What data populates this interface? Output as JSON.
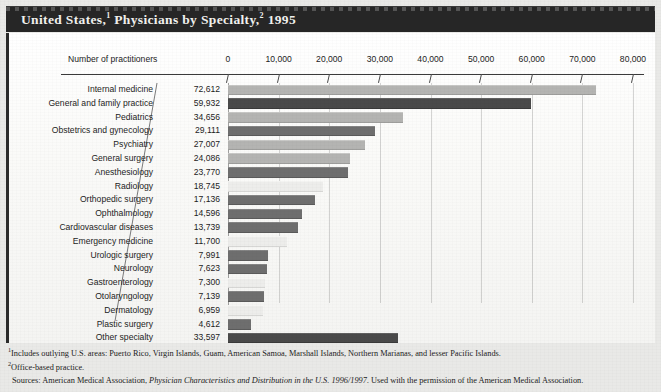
{
  "title": {
    "part1": "United States,",
    "sup1": "1",
    "part2": " Physicians by Specialty,",
    "sup2": "2",
    "part3": " 1995"
  },
  "axis_title": "Number of practitioners",
  "footnotes": {
    "note1_sup": "1",
    "note1": "Includes outlying U.S. areas: Puerto Rico, Virgin Islands, Guam, American Samoa, Marshall Islands, Northern Marianas, and lesser Pacific Islands.",
    "note2_sup": "2",
    "note2": "Office-based practice.",
    "source_prefix": "Sources: American Medical Association, ",
    "source_italic": "Physician Characteristics and Distribution in the U.S. 1996/1997.",
    "source_suffix": " Used with the permission of the American Medical Association."
  },
  "colors": {
    "background": "#e9e9e7",
    "panel": "#fbfbfa",
    "titlebar": "#262626",
    "bar_light": "#b4b4b2",
    "bar_dark": "#6e6e6e",
    "bar_vlight": "#ededeb",
    "bar_vdark": "#4a4a4a"
  },
  "chart_data": {
    "type": "bar",
    "orientation": "horizontal",
    "xlabel": "Number of practitioners",
    "ylabel": "",
    "xlim": [
      0,
      80000
    ],
    "xticks": [
      0,
      10000,
      20000,
      30000,
      40000,
      50000,
      60000,
      70000,
      80000
    ],
    "xticklabels": [
      "0",
      "10,000",
      "20,000",
      "30,000",
      "40,000",
      "50,000",
      "60,000",
      "70,000",
      "80,000"
    ],
    "grid": true,
    "legend": "none",
    "categories": [
      "Internal medicine",
      "General and family practice",
      "Pediatrics",
      "Obstetrics and gynecology",
      "Psychiatry",
      "General surgery",
      "Anesthesiology",
      "Radiology",
      "Orthopedic surgery",
      "Ophthalmology",
      "Cardiovascular diseases",
      "Emergency medicine",
      "Urologic surgery",
      "Neurology",
      "Gastroenterology",
      "Otolaryngology",
      "Dermatology",
      "Plastic surgery",
      "Other specialty"
    ],
    "values": [
      72612,
      59932,
      34656,
      29111,
      27007,
      24086,
      23770,
      18745,
      17136,
      14596,
      13739,
      11700,
      7991,
      7623,
      7300,
      7139,
      6959,
      4612,
      33597
    ],
    "value_labels": [
      "72,612",
      "59,932",
      "34,656",
      "29,111",
      "27,007",
      "24,086",
      "23,770",
      "18,745",
      "17,136",
      "14,596",
      "13,739",
      "11,700",
      "7,991",
      "7,623",
      "7,300",
      "7,139",
      "6,959",
      "4,612",
      "33,597"
    ],
    "bar_shades": [
      "light",
      "vdark",
      "light",
      "dark",
      "light",
      "light",
      "dark",
      "vlight",
      "dark",
      "dark",
      "dark",
      "vlight",
      "dark",
      "dark",
      "vlight",
      "dark",
      "vlight",
      "dark",
      "vdark"
    ]
  }
}
